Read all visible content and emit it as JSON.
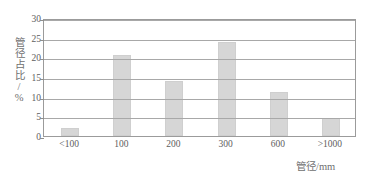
{
  "chart_data": {
    "type": "bar",
    "title": "",
    "subtitle": "",
    "xlabel": "管径/mm",
    "ylabel": "管径占比/%",
    "categories": [
      "<100",
      "100",
      "200",
      "300",
      "600",
      ">1000"
    ],
    "values": [
      2.0,
      20.5,
      14.0,
      24.0,
      11.3,
      4.6
    ],
    "series": [
      {
        "name": "管径占比",
        "values": [
          2.0,
          20.5,
          14.0,
          24.0,
          11.3,
          4.6
        ]
      }
    ],
    "ylim": [
      0,
      30
    ],
    "yticks": [
      0,
      5,
      10,
      15,
      20,
      25,
      30
    ],
    "ytick_labels": [
      "0",
      "5",
      "10",
      "15",
      "20",
      "25",
      "30"
    ],
    "grid": true,
    "grid_axis": "y",
    "legend": false,
    "legend_position": "none",
    "annotations": [],
    "colors": {
      "bar_fill": "#d6d6d6",
      "bar_border": "#cfcfcf",
      "gridline": "#a8a8a8",
      "frame": "#9b9b9b",
      "tick_text": "#5e5e5e",
      "axis_title": "#6f6f6f",
      "background": "#ffffff"
    }
  }
}
